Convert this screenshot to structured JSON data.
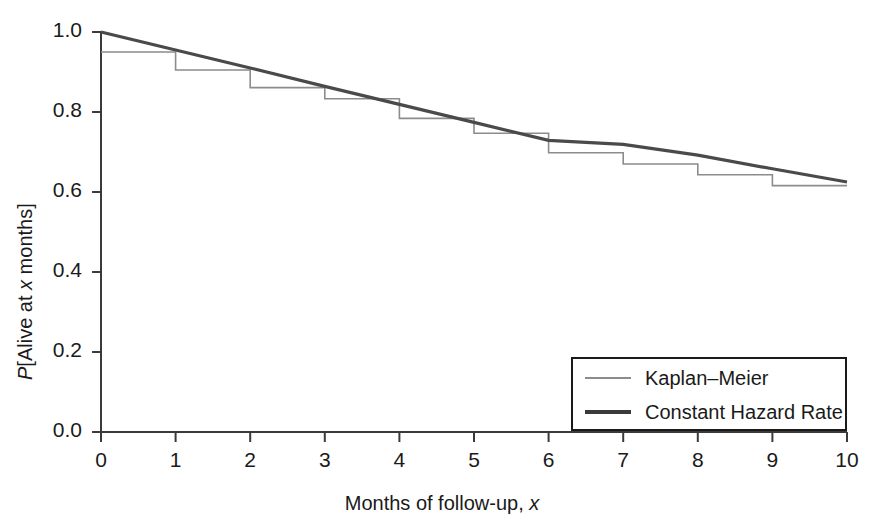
{
  "chart_data": {
    "type": "line",
    "title": "",
    "xlabel": "Months of follow-up, x",
    "xlabel_parts": {
      "text": "Months of follow-up, ",
      "italic": "x"
    },
    "ylabel": "P[Alive at x months]",
    "ylabel_parts": {
      "italic_lead": "P",
      "mid": "[Alive at ",
      "italic": "x",
      "tail": " months]"
    },
    "xlim": [
      0,
      10
    ],
    "ylim": [
      0.0,
      1.0
    ],
    "xticks": [
      "0",
      "1",
      "2",
      "3",
      "4",
      "5",
      "6",
      "7",
      "8",
      "9",
      "10"
    ],
    "xtick_values": [
      0,
      1,
      2,
      3,
      4,
      5,
      6,
      7,
      8,
      9,
      10
    ],
    "yticks": [
      "0.0",
      "0.2",
      "0.4",
      "0.6",
      "0.8",
      "1.0"
    ],
    "ytick_values": [
      0.0,
      0.2,
      0.4,
      0.6,
      0.8,
      1.0
    ],
    "grid": false,
    "legend_position": "lower right",
    "series": [
      {
        "name": "Kaplan-Meier",
        "style": "step",
        "color": "#8c8c8c",
        "linewidth": 1.6,
        "x": [
          0,
          1,
          2,
          3,
          4,
          5,
          6,
          7,
          8,
          9,
          10
        ],
        "values": [
          0.95,
          0.905,
          0.861,
          0.833,
          0.784,
          0.747,
          0.698,
          0.67,
          0.643,
          0.616,
          0.616
        ]
      },
      {
        "name": "Constant Hazard Rate",
        "style": "line",
        "color": "#4a4a4a",
        "linewidth": 3.2,
        "x": [
          0,
          1,
          2,
          3,
          4,
          5,
          6,
          7,
          8,
          9,
          10
        ],
        "values": [
          1.0,
          0.955,
          0.91,
          0.864,
          0.819,
          0.774,
          0.729,
          0.719,
          0.692,
          0.658,
          0.625
        ]
      }
    ],
    "legend": [
      {
        "label": "Kaplan–Meier",
        "color": "#8c8c8c",
        "linewidth": 2
      },
      {
        "label": "Constant Hazard Rate",
        "color": "#3a3a3a",
        "linewidth": 4
      }
    ]
  },
  "axes": {
    "axis_color": "#3a3a3a",
    "text_color": "#1a1a1a"
  }
}
